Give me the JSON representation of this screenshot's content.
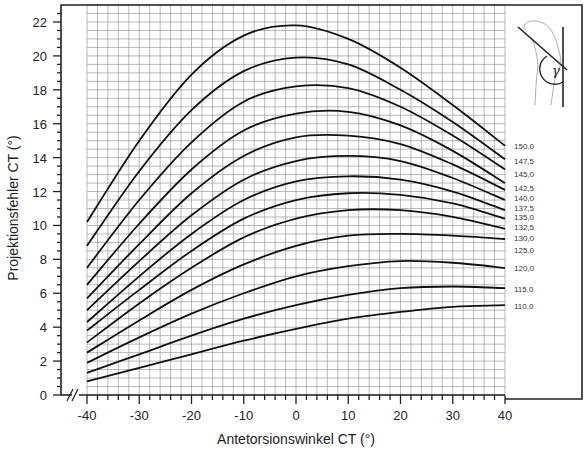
{
  "chart_data": {
    "type": "line",
    "title": "",
    "xlabel": "Antetorsionswinkel CT (°)",
    "ylabel": "Projektionsfehler CT (°)",
    "xlim": [
      -40,
      40
    ],
    "ylim": [
      0,
      22
    ],
    "x_ticks": [
      -40,
      -30,
      -20,
      -10,
      0,
      10,
      20,
      30,
      40
    ],
    "y_ticks": [
      0,
      2,
      4,
      6,
      8,
      10,
      12,
      14,
      16,
      18,
      20,
      22
    ],
    "grid": true,
    "grid_minor_x": 2,
    "grid_minor_y": 0.5,
    "axis_break": "//",
    "legend_position": "right, inline curve labels",
    "inset": {
      "description": "femur sketch with neck-shaft angle",
      "symbol": "γ"
    },
    "x": [
      -40,
      -30,
      -20,
      -10,
      0,
      10,
      20,
      30,
      40
    ],
    "series": [
      {
        "name": "150,0",
        "values": [
          10.2,
          15.0,
          18.9,
          21.2,
          21.8,
          21.0,
          19.3,
          17.1,
          14.7
        ]
      },
      {
        "name": "147,5",
        "values": [
          8.8,
          13.2,
          16.8,
          19.1,
          19.9,
          19.5,
          18.0,
          16.1,
          13.9
        ]
      },
      {
        "name": "145,0",
        "values": [
          7.5,
          11.5,
          14.9,
          17.3,
          18.2,
          18.1,
          17.0,
          15.3,
          13.3
        ]
      },
      {
        "name": "142,5",
        "values": [
          6.5,
          10.1,
          13.3,
          15.6,
          16.6,
          16.7,
          15.9,
          14.4,
          12.5
        ]
      },
      {
        "name": "140,0",
        "values": [
          5.7,
          8.9,
          11.9,
          14.1,
          15.2,
          15.3,
          14.8,
          13.6,
          12.1
        ]
      },
      {
        "name": "137,5",
        "values": [
          5.0,
          7.9,
          10.6,
          12.7,
          13.8,
          14.1,
          13.8,
          12.8,
          11.5
        ]
      },
      {
        "name": "135,0",
        "values": [
          4.3,
          7.0,
          9.5,
          11.5,
          12.6,
          12.9,
          12.7,
          12.0,
          10.9
        ]
      },
      {
        "name": "132,5",
        "values": [
          3.8,
          6.2,
          8.5,
          10.4,
          11.5,
          11.9,
          11.8,
          11.3,
          10.4
        ]
      },
      {
        "name": "130,0",
        "values": [
          3.1,
          5.4,
          7.5,
          9.3,
          10.4,
          10.9,
          10.9,
          10.5,
          9.8
        ]
      },
      {
        "name": "125,0",
        "values": [
          2.5,
          4.4,
          6.2,
          7.7,
          8.8,
          9.4,
          9.5,
          9.4,
          9.2
        ]
      },
      {
        "name": "120,0",
        "values": [
          1.9,
          3.4,
          4.8,
          6.0,
          7.0,
          7.6,
          7.9,
          7.8,
          7.5
        ]
      },
      {
        "name": "115,0",
        "values": [
          1.3,
          2.4,
          3.5,
          4.5,
          5.3,
          5.9,
          6.3,
          6.4,
          6.3
        ]
      },
      {
        "name": "110,0",
        "values": [
          0.8,
          1.6,
          2.4,
          3.2,
          3.9,
          4.5,
          4.9,
          5.2,
          5.3
        ]
      }
    ],
    "curve_labels": [
      "150,0",
      "147,5",
      "145,0",
      "142,5",
      "140,0",
      "137,5",
      "135,0",
      "132,5",
      "130,0",
      "125,0",
      "120,0",
      "115,0",
      "110,0"
    ],
    "curve_label_y_px": [
      146,
      161,
      174,
      188,
      198,
      208,
      217,
      227,
      238,
      250,
      268,
      289,
      306
    ]
  }
}
